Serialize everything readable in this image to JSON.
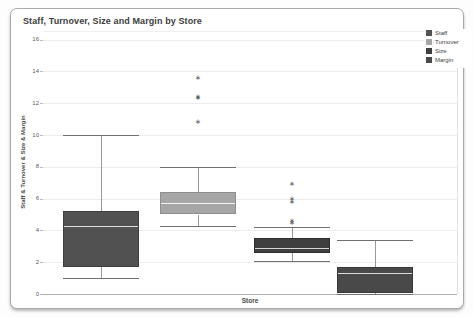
{
  "chart_data": {
    "type": "boxplot",
    "title": "Staff, Turnover, Size and Margin by Store",
    "xlabel": "Store",
    "ylabel": "Staff & Turnover & Size & Margin",
    "ylim": [
      0,
      16
    ],
    "yticks": [
      16,
      14,
      12,
      10,
      8,
      6,
      4,
      2,
      0
    ],
    "grid": true,
    "legend_position": "top-right",
    "series": [
      {
        "name": "Staff",
        "color": "#515151",
        "border_color": "#3e3e3e",
        "median_color": "#dcdcdc",
        "min": 1.0,
        "q1": 1.7,
        "median": 4.3,
        "q3": 5.2,
        "max": 10.0,
        "outliers": []
      },
      {
        "name": "Turnover",
        "color": "#a6a6a6",
        "border_color": "#8f8f8f",
        "median_color": "#f2f2f2",
        "min": 4.3,
        "q1": 5.0,
        "median": 5.7,
        "q3": 6.4,
        "max": 8.0,
        "outliers": [
          10.8,
          12.3,
          12.4,
          13.6
        ]
      },
      {
        "name": "Size",
        "color": "#3f3f3f",
        "border_color": "#2f2f2f",
        "median_color": "#d6d6d6",
        "min": 2.1,
        "q1": 2.6,
        "median": 2.9,
        "q3": 3.5,
        "max": 4.2,
        "outliers": [
          4.45,
          4.6,
          5.8,
          6.0,
          6.9
        ]
      },
      {
        "name": "Margin",
        "color": "#494949",
        "border_color": "#383838",
        "median_color": "#dcdcdc",
        "min": 0.0,
        "q1": 0.05,
        "median": 1.3,
        "q3": 1.7,
        "max": 3.4,
        "outliers": []
      }
    ]
  }
}
